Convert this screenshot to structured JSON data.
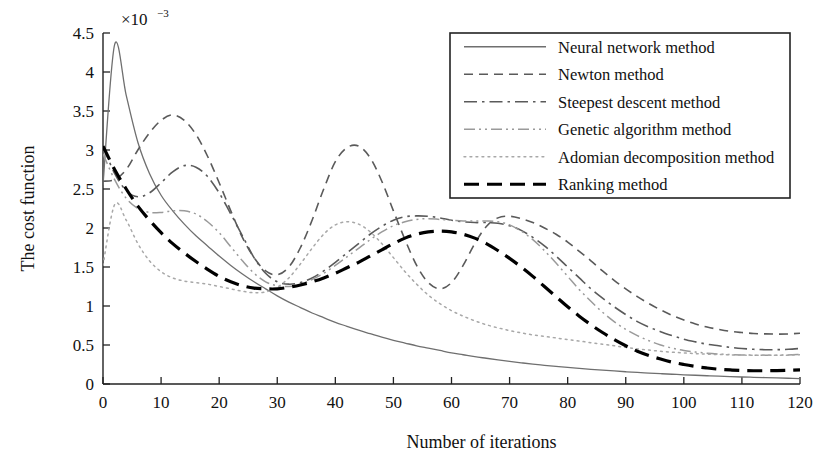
{
  "chart_data": {
    "type": "line",
    "title": "",
    "xlabel": "Number of iterations",
    "ylabel": "The cost function",
    "y_exponent_base": "×10",
    "y_exponent_power": "−3",
    "y_scale_note": "×10⁻³",
    "xlim": [
      0,
      120
    ],
    "ylim": [
      0,
      4.5
    ],
    "xticks": [
      0,
      10,
      20,
      30,
      40,
      50,
      60,
      70,
      80,
      90,
      100,
      110,
      120
    ],
    "xticklabels": [
      "0",
      "10",
      "20",
      "30",
      "40",
      "50",
      "60",
      "70",
      "80",
      "90",
      "100",
      "110",
      "120"
    ],
    "yticks": [
      0,
      0.5,
      1,
      1.5,
      2,
      2.5,
      3,
      3.5,
      4,
      4.5
    ],
    "yticklabels": [
      "0",
      "0.5",
      "1",
      "1.5",
      "2",
      "2.5",
      "3",
      "3.5",
      "4",
      "4.5"
    ],
    "grid": false,
    "legend_position": "top-right",
    "x": [
      0,
      2,
      4,
      6,
      8,
      10,
      12,
      14,
      16,
      18,
      20,
      22,
      24,
      26,
      28,
      30,
      32,
      34,
      36,
      38,
      40,
      42,
      44,
      46,
      48,
      50,
      52,
      54,
      56,
      58,
      60,
      62,
      64,
      66,
      68,
      70,
      72,
      74,
      76,
      78,
      80,
      82,
      84,
      86,
      88,
      90,
      92,
      94,
      96,
      98,
      100,
      102,
      104,
      106,
      108,
      110,
      112,
      114,
      116,
      118,
      120
    ],
    "series": [
      {
        "name": "Neural network method",
        "linestyle": "solid",
        "color": "#6f6f6f",
        "width": 1.3,
        "values": [
          2.55,
          4.35,
          3.7,
          3.1,
          2.7,
          2.42,
          2.22,
          2.05,
          1.9,
          1.77,
          1.64,
          1.52,
          1.41,
          1.31,
          1.22,
          1.13,
          1.05,
          0.98,
          0.91,
          0.85,
          0.79,
          0.74,
          0.69,
          0.645,
          0.6,
          0.56,
          0.525,
          0.49,
          0.46,
          0.43,
          0.4,
          0.375,
          0.35,
          0.33,
          0.31,
          0.29,
          0.272,
          0.255,
          0.24,
          0.225,
          0.212,
          0.2,
          0.188,
          0.177,
          0.167,
          0.157,
          0.148,
          0.14,
          0.132,
          0.125,
          0.118,
          0.112,
          0.106,
          0.1,
          0.095,
          0.09,
          0.086,
          0.082,
          0.078,
          0.074,
          0.07
        ]
      },
      {
        "name": "Newton method",
        "linestyle": "dashed",
        "color": "#5a5a5a",
        "width": 1.6,
        "values": [
          2.6,
          2.62,
          2.75,
          3.0,
          3.22,
          3.38,
          3.45,
          3.38,
          3.2,
          2.92,
          2.58,
          2.22,
          1.88,
          1.62,
          1.45,
          1.4,
          1.5,
          1.75,
          2.1,
          2.5,
          2.85,
          3.03,
          3.05,
          2.9,
          2.6,
          2.22,
          1.85,
          1.52,
          1.3,
          1.22,
          1.3,
          1.52,
          1.8,
          2.02,
          2.13,
          2.15,
          2.12,
          2.07,
          2.0,
          1.92,
          1.82,
          1.7,
          1.58,
          1.45,
          1.33,
          1.22,
          1.12,
          1.03,
          0.95,
          0.88,
          0.82,
          0.77,
          0.73,
          0.7,
          0.675,
          0.66,
          0.648,
          0.642,
          0.64,
          0.642,
          0.65
        ]
      },
      {
        "name": "Steepest descent method",
        "linestyle": "dashdot",
        "color": "#5a5a5a",
        "width": 1.6,
        "values": [
          3.05,
          2.7,
          2.48,
          2.4,
          2.45,
          2.58,
          2.72,
          2.8,
          2.78,
          2.66,
          2.45,
          2.18,
          1.9,
          1.62,
          1.42,
          1.31,
          1.28,
          1.3,
          1.36,
          1.45,
          1.56,
          1.68,
          1.8,
          1.92,
          2.02,
          2.1,
          2.145,
          2.155,
          2.15,
          2.13,
          2.1,
          2.08,
          2.07,
          2.07,
          2.06,
          2.03,
          1.97,
          1.88,
          1.77,
          1.64,
          1.5,
          1.36,
          1.22,
          1.1,
          0.99,
          0.89,
          0.8,
          0.73,
          0.67,
          0.62,
          0.575,
          0.54,
          0.51,
          0.49,
          0.47,
          0.455,
          0.445,
          0.44,
          0.44,
          0.445,
          0.455
        ]
      },
      {
        "name": "Genetic algorithm method",
        "linestyle": "dashdotdot",
        "color": "#9a9a9a",
        "width": 1.5,
        "values": [
          2.95,
          2.62,
          2.38,
          2.25,
          2.2,
          2.2,
          2.22,
          2.22,
          2.18,
          2.08,
          1.94,
          1.76,
          1.58,
          1.42,
          1.31,
          1.26,
          1.25,
          1.28,
          1.34,
          1.42,
          1.52,
          1.63,
          1.74,
          1.85,
          1.95,
          2.03,
          2.08,
          2.11,
          2.12,
          2.11,
          2.1,
          2.09,
          2.09,
          2.09,
          2.08,
          2.04,
          1.96,
          1.85,
          1.71,
          1.55,
          1.38,
          1.21,
          1.06,
          0.92,
          0.8,
          0.7,
          0.62,
          0.555,
          0.5,
          0.46,
          0.43,
          0.41,
          0.395,
          0.385,
          0.378,
          0.373,
          0.37,
          0.369,
          0.37,
          0.373,
          0.38
        ]
      },
      {
        "name": "Adomian decomposition method",
        "linestyle": "dotted",
        "color": "#a8a8a8",
        "width": 1.5,
        "values": [
          1.52,
          2.3,
          2.1,
          1.8,
          1.58,
          1.44,
          1.36,
          1.32,
          1.3,
          1.28,
          1.25,
          1.22,
          1.19,
          1.17,
          1.18,
          1.24,
          1.36,
          1.54,
          1.74,
          1.92,
          2.04,
          2.08,
          2.05,
          1.95,
          1.8,
          1.62,
          1.44,
          1.28,
          1.14,
          1.03,
          0.94,
          0.87,
          0.81,
          0.76,
          0.72,
          0.685,
          0.655,
          0.63,
          0.61,
          0.59,
          0.57,
          0.55,
          0.53,
          0.51,
          0.49,
          0.47,
          0.45,
          0.435,
          0.42,
          0.408,
          0.398,
          0.39,
          0.383,
          0.378,
          0.374,
          0.371,
          0.369,
          0.368,
          0.368,
          0.37,
          0.375
        ]
      },
      {
        "name": "Ranking method",
        "linestyle": "bold-dashed",
        "color": "#000000",
        "width": 3.2,
        "values": [
          3.05,
          2.75,
          2.5,
          2.28,
          2.1,
          1.94,
          1.8,
          1.68,
          1.57,
          1.47,
          1.38,
          1.31,
          1.26,
          1.23,
          1.22,
          1.22,
          1.24,
          1.27,
          1.31,
          1.36,
          1.42,
          1.49,
          1.56,
          1.64,
          1.72,
          1.8,
          1.87,
          1.92,
          1.95,
          1.96,
          1.95,
          1.92,
          1.87,
          1.8,
          1.71,
          1.61,
          1.5,
          1.38,
          1.25,
          1.12,
          0.99,
          0.87,
          0.76,
          0.66,
          0.57,
          0.49,
          0.42,
          0.365,
          0.32,
          0.28,
          0.25,
          0.225,
          0.205,
          0.19,
          0.18,
          0.173,
          0.17,
          0.17,
          0.172,
          0.176,
          0.182
        ]
      }
    ],
    "legend": [
      {
        "label": "Neural network method",
        "style": "solid"
      },
      {
        "label": "Newton method",
        "style": "dashed"
      },
      {
        "label": "Steepest descent method",
        "style": "dashdot"
      },
      {
        "label": "Genetic algorithm method",
        "style": "dashdotdot"
      },
      {
        "label": "Adomian decomposition method",
        "style": "dotted"
      },
      {
        "label": "Ranking method",
        "style": "bold-dashed"
      }
    ]
  }
}
